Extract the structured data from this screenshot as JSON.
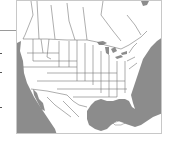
{
  "map": {
    "region": "North America",
    "style": "state and province outline map",
    "colors": {
      "land": "#ffffff",
      "water": "#8c8c8c",
      "borders": "#777777",
      "frame": "#c8c8c8",
      "leader_line": "#9a9a9a"
    },
    "features": [
      "United States",
      "Canada",
      "Mexico",
      "Great Lakes",
      "Gulf of Mexico",
      "Atlantic Ocean",
      "Pacific Ocean",
      "Cuba"
    ]
  }
}
